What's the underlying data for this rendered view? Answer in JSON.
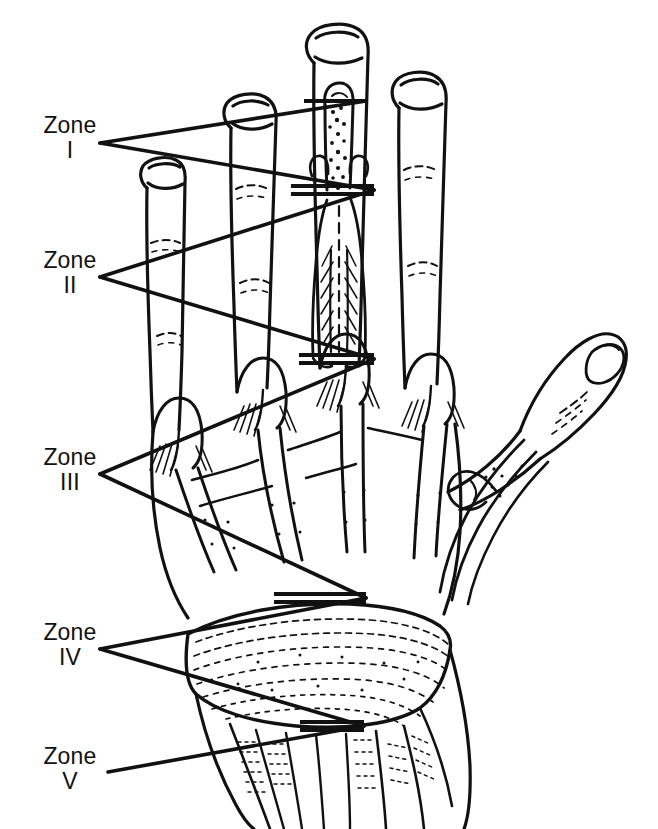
{
  "figure": {
    "background_color": "#ffffff",
    "ink_color": "#111111",
    "view": "dorsal view of right hand and wrist",
    "width": 658,
    "height": 829
  },
  "labels": {
    "zone_word": "Zone",
    "zones": [
      {
        "id": "zone-1",
        "word": "Zone",
        "numeral": "I"
      },
      {
        "id": "zone-2",
        "word": "Zone",
        "numeral": "II"
      },
      {
        "id": "zone-3",
        "word": "Zone",
        "numeral": "III"
      },
      {
        "id": "zone-4",
        "word": "Zone",
        "numeral": "IV"
      },
      {
        "id": "zone-5",
        "word": "Zone",
        "numeral": "V"
      }
    ]
  },
  "icons": {
    "leader_line": "leader-line",
    "tick_mark": "zone-boundary-tick"
  }
}
